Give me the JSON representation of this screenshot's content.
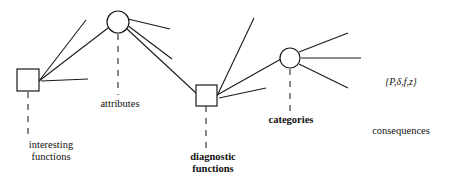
{
  "diagram": {
    "type": "node-link-diagram",
    "background_color": "#ffffff",
    "stroke_color": "#1a1a1a",
    "nodes": [
      {
        "id": "interesting-functions",
        "shape": "square",
        "cx": 28,
        "cy": 80,
        "size": 22,
        "label": "interesting\nfunctions",
        "bold": false
      },
      {
        "id": "attributes",
        "shape": "circle",
        "cx": 118,
        "cy": 22,
        "r": 11,
        "label": "attributes",
        "bold": false
      },
      {
        "id": "diagnostic-functions",
        "shape": "square",
        "cx": 206,
        "cy": 95,
        "size": 21,
        "label": "diagnostic\nfunctions",
        "bold": true
      },
      {
        "id": "categories",
        "shape": "circle",
        "cx": 290,
        "cy": 58,
        "r": 10,
        "label": "categories",
        "bold": true
      }
    ],
    "labels": {
      "interesting_functions": "interesting\nfunctions",
      "attributes": "attributes",
      "diagnostic_functions": "diagnostic\nfunctions",
      "categories": "categories",
      "consequences_set": "{P,δ,f,z}",
      "consequences": "consequences"
    },
    "edges": [
      {
        "from": "interesting-functions",
        "to": "free-upper-right",
        "x1": 39,
        "y1": 81,
        "x2": 86,
        "y2": 20
      },
      {
        "from": "interesting-functions",
        "to": "attributes",
        "x1": 39,
        "y1": 81,
        "x2": 108,
        "y2": 27
      },
      {
        "from": "interesting-functions",
        "to": "free-right",
        "x1": 41,
        "y1": 81,
        "x2": 88,
        "y2": 79
      },
      {
        "from": "attributes",
        "to": "free-right-upper",
        "x1": 128,
        "y1": 19,
        "x2": 170,
        "y2": 29
      },
      {
        "from": "attributes",
        "to": "free-right-lower",
        "x1": 127,
        "y1": 25,
        "x2": 172,
        "y2": 59
      },
      {
        "from": "attributes",
        "to": "diagnostic-functions",
        "x1": 126,
        "y1": 28,
        "x2": 196,
        "y2": 94
      },
      {
        "from": "diagnostic-functions",
        "to": "free-upper-right",
        "x1": 217,
        "y1": 96,
        "x2": 254,
        "y2": 18
      },
      {
        "from": "diagnostic-functions",
        "to": "categories",
        "x1": 217,
        "y1": 96,
        "x2": 280,
        "y2": 58
      },
      {
        "from": "diagnostic-functions",
        "to": "free-right",
        "x1": 219,
        "y1": 97,
        "x2": 266,
        "y2": 88
      },
      {
        "from": "categories",
        "to": "free-upper-right",
        "x1": 299,
        "y1": 52,
        "x2": 348,
        "y2": 33
      },
      {
        "from": "categories",
        "to": "consequences",
        "x1": 301,
        "y1": 58,
        "x2": 360,
        "y2": 58
      },
      {
        "from": "categories",
        "to": "free-lower-right",
        "x1": 299,
        "y1": 64,
        "x2": 348,
        "y2": 88
      }
    ],
    "dashed_connectors": [
      {
        "node": "interesting-functions",
        "x": 28,
        "y1": 92,
        "y2": 136
      },
      {
        "node": "attributes",
        "x": 118,
        "y1": 34,
        "y2": 94
      },
      {
        "node": "diagnostic-functions",
        "x": 206,
        "y1": 106,
        "y2": 148
      },
      {
        "node": "categories",
        "x": 290,
        "y1": 69,
        "y2": 110
      }
    ]
  }
}
